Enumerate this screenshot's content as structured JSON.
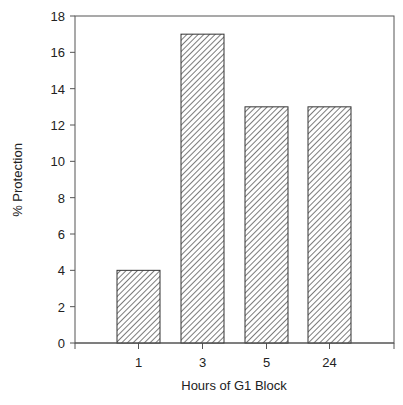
{
  "chart_data": {
    "type": "bar",
    "title": "",
    "xlabel": "Hours of G1 Block",
    "ylabel": "% Protection",
    "categories": [
      "1",
      "3",
      "5",
      "24"
    ],
    "values": [
      4,
      17,
      13,
      13
    ],
    "ylim": [
      0,
      18
    ],
    "yticks": [
      0,
      2,
      4,
      6,
      8,
      10,
      12,
      14,
      16,
      18
    ],
    "grid": false,
    "legend": null,
    "bar_fill": "diagonal-hatch",
    "bar_color": "#333333"
  }
}
